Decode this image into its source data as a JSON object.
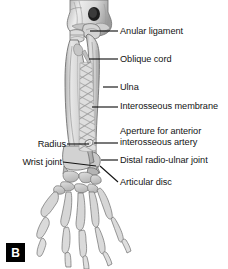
{
  "figure": {
    "panel_letter": "B",
    "background_color": "#ffffff",
    "line_color": "#141414",
    "bone_fill_light": "#e4e4e4",
    "bone_fill_mid": "#c9c9c9",
    "bone_fill_dark": "#a9a9a9",
    "bone_outline": "#6f6f6f",
    "membrane_fill": "#dcdcdc",
    "membrane_stripe": "#9c9c9c"
  },
  "labels": [
    {
      "id": "anular-ligament",
      "text": "Anular ligament",
      "side": "right",
      "x": 120,
      "y": 26,
      "leader": {
        "x1": 90,
        "y1": 31,
        "x2": 118,
        "y2": 31
      }
    },
    {
      "id": "oblique-cord",
      "text": "Oblique cord",
      "side": "right",
      "x": 120,
      "y": 54,
      "leader": {
        "x1": 89,
        "y1": 59,
        "x2": 118,
        "y2": 59
      }
    },
    {
      "id": "ulna",
      "text": "Ulna",
      "side": "right",
      "x": 120,
      "y": 82,
      "leader": {
        "x1": 103,
        "y1": 87,
        "x2": 118,
        "y2": 87
      }
    },
    {
      "id": "interosseous-membrane",
      "text": "Interosseous membrane",
      "side": "right",
      "x": 120,
      "y": 101,
      "leader": {
        "x1": 92,
        "y1": 107,
        "x2": 118,
        "y2": 107
      }
    },
    {
      "id": "aperture-anterior-interosseous-artery",
      "text": "Aperture for anterior interosseous artery",
      "side": "right",
      "x": 120,
      "y": 126,
      "leader": {
        "x1": 94,
        "y1": 143,
        "x2": 118,
        "y2": 143
      }
    },
    {
      "id": "distal-radio-ulnar-joint",
      "text": "Distal radio-ulnar joint",
      "side": "right",
      "x": 120,
      "y": 155,
      "leader": {
        "x1": 101,
        "y1": 160,
        "x2": 118,
        "y2": 160
      }
    },
    {
      "id": "articular-disc",
      "text": "Articular disc",
      "side": "right",
      "x": 120,
      "y": 177,
      "leader": {
        "x1": 100,
        "y1": 166,
        "x2": 118,
        "y2": 182
      }
    },
    {
      "id": "radius",
      "text": "Radius",
      "side": "left",
      "x": 26,
      "y": 139,
      "leader": {
        "x1": 67,
        "y1": 144,
        "x2": 89,
        "y2": 144
      }
    },
    {
      "id": "wrist-joint",
      "text": "Wrist joint",
      "side": "left",
      "x": 12,
      "y": 157,
      "leader": {
        "x1": 63,
        "y1": 162,
        "x2": 96,
        "y2": 166
      }
    }
  ]
}
